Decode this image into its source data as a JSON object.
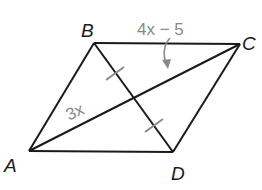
{
  "figure": {
    "type": "parallelogram",
    "vertices": {
      "A": {
        "label": "A",
        "x": 29,
        "y": 151
      },
      "B": {
        "label": "B",
        "x": 94,
        "y": 43
      },
      "C": {
        "label": "C",
        "x": 240,
        "y": 44
      },
      "D": {
        "label": "D",
        "x": 173,
        "y": 152
      }
    },
    "segment_labels": {
      "BC_upper": "4x − 5",
      "AE": "3x"
    },
    "tick_marks": "BE ≅ ED (diagonal BD bisected)",
    "colors": {
      "line": "#1a1a1a",
      "measure_text": "#8a8a8a",
      "tick": "#8a8a8a"
    }
  }
}
